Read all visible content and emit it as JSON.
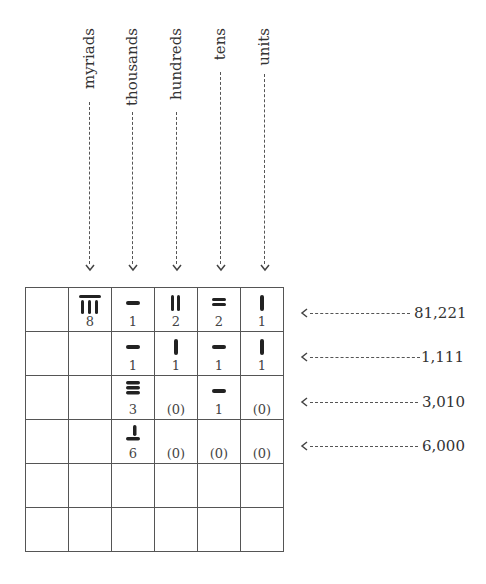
{
  "columns": [
    {
      "label": "myriads"
    },
    {
      "label": "thousands"
    },
    {
      "label": "hundreds"
    },
    {
      "label": "tens"
    },
    {
      "label": "units"
    }
  ],
  "rows": [
    {
      "digits": [
        "8",
        "1",
        "2",
        "2",
        "1"
      ],
      "value": "81,221"
    },
    {
      "digits": [
        "",
        "1",
        "1",
        "1",
        "1"
      ],
      "value": "1,111"
    },
    {
      "digits": [
        "",
        "3",
        "(0)",
        "1",
        "(0)"
      ],
      "value": "3,010"
    },
    {
      "digits": [
        "",
        "6",
        "(0)",
        "(0)",
        "(0)"
      ],
      "value": "6,000"
    },
    {
      "digits": [
        "",
        "",
        "",
        "",
        ""
      ],
      "value": ""
    },
    {
      "digits": [
        "",
        "",
        "",
        "",
        ""
      ],
      "value": ""
    }
  ],
  "colors": {
    "ink": "#333333",
    "rod": "#222222",
    "grid": "#555555"
  }
}
